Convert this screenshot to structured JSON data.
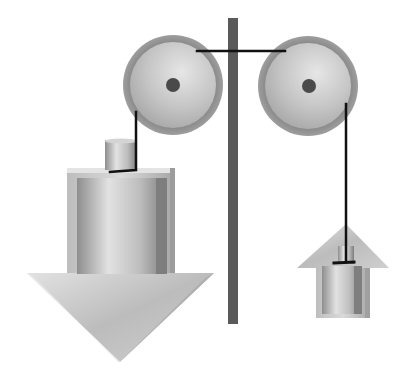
{
  "diagram": {
    "title": "Two pulleys with hanging weights",
    "colors": {
      "post": "#5a5a5a",
      "pulley_rim": "#7a7a7a",
      "pulley_face": "#c8c8c8",
      "hub": "#4a4a4a",
      "rope": "#111111",
      "arrow_light": "#d9d9d9",
      "arrow_dark": "#9a9a9a",
      "background": "#ffffff"
    },
    "elements": {
      "left_pulley": "left pulley",
      "right_pulley": "right pulley",
      "post": "vertical support post",
      "rope": "connecting rope",
      "down_arrow": "large downward arrow (heavier side)",
      "up_arrow": "small upward arrow (lighter side)",
      "heavy_weight": "large cylindrical weight",
      "light_weight": "small cylindrical weight"
    }
  }
}
